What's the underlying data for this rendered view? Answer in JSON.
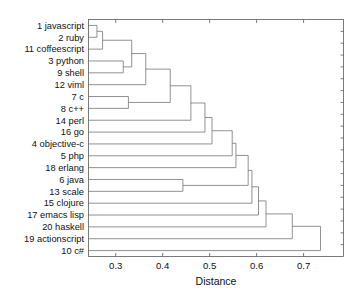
{
  "chart_data": {
    "type": "dendrogram",
    "title": "",
    "xlabel": "Distance",
    "ylabel": "",
    "xlim": [
      0.242,
      0.785
    ],
    "ylim": [
      0,
      20
    ],
    "grid": false,
    "legend": null,
    "orientation": "horizontal-left-to-right",
    "xticks": [
      0.3,
      0.4,
      0.5,
      0.6,
      0.7
    ],
    "xtick_labels": [
      "0.3",
      "0.4",
      "0.5",
      "0.6",
      "0.7"
    ],
    "leaf_order": [
      "1 javascript",
      "2 ruby",
      "11 coffeescript",
      "3 python",
      "9 shell",
      "12 viml",
      "7 c",
      "8 c++",
      "14 perl",
      "16 go",
      "4 objective-c",
      "5 php",
      "18 erlang",
      "6 java",
      "13 scale",
      "15 clojure",
      "17 emacs lisp",
      "20 haskell",
      "19 actionscript",
      "10 c#"
    ],
    "leaves": [
      {
        "index": 0,
        "id": 1,
        "name": "javascript"
      },
      {
        "index": 1,
        "id": 2,
        "name": "ruby"
      },
      {
        "index": 2,
        "id": 11,
        "name": "coffeescript"
      },
      {
        "index": 3,
        "id": 3,
        "name": "python"
      },
      {
        "index": 4,
        "id": 9,
        "name": "shell"
      },
      {
        "index": 5,
        "id": 12,
        "name": "viml"
      },
      {
        "index": 6,
        "id": 7,
        "name": "c"
      },
      {
        "index": 7,
        "id": 8,
        "name": "c++"
      },
      {
        "index": 8,
        "id": 14,
        "name": "perl"
      },
      {
        "index": 9,
        "id": 16,
        "name": "go"
      },
      {
        "index": 10,
        "id": 4,
        "name": "objective-c"
      },
      {
        "index": 11,
        "id": 5,
        "name": "php"
      },
      {
        "index": 12,
        "id": 18,
        "name": "erlang"
      },
      {
        "index": 13,
        "id": 6,
        "name": "java"
      },
      {
        "index": 14,
        "id": 13,
        "name": "scale"
      },
      {
        "index": 15,
        "id": 15,
        "name": "clojure"
      },
      {
        "index": 16,
        "id": 17,
        "name": "emacs lisp"
      },
      {
        "index": 17,
        "id": 20,
        "name": "haskell"
      },
      {
        "index": 18,
        "id": 19,
        "name": "actionscript"
      },
      {
        "index": 19,
        "id": 10,
        "name": "c#"
      }
    ],
    "merges": [
      {
        "id": "m1",
        "left": "leaf:0",
        "right": "leaf:1",
        "distance": 0.26,
        "label": "javascript + ruby"
      },
      {
        "id": "m2",
        "left": "m1",
        "right": "leaf:2",
        "distance": 0.272,
        "label": "+ coffeescript"
      },
      {
        "id": "m3",
        "left": "leaf:3",
        "right": "leaf:4",
        "distance": 0.316,
        "label": "python + shell"
      },
      {
        "id": "m4",
        "left": "m2",
        "right": "m3",
        "distance": 0.334,
        "label": "script-cluster"
      },
      {
        "id": "m5",
        "left": "m4",
        "right": "leaf:5",
        "distance": 0.364,
        "label": "+ viml"
      },
      {
        "id": "m6",
        "left": "leaf:6",
        "right": "leaf:7",
        "distance": 0.327,
        "label": "c + c++"
      },
      {
        "id": "m7",
        "left": "m5",
        "right": "m6",
        "distance": 0.416,
        "label": "c-family join"
      },
      {
        "id": "m8",
        "left": "m7",
        "right": "leaf:8",
        "distance": 0.46,
        "label": "+ perl"
      },
      {
        "id": "m9",
        "left": "m8",
        "right": "leaf:9",
        "distance": 0.49,
        "label": "+ go"
      },
      {
        "id": "m10",
        "left": "m9",
        "right": "leaf:10",
        "distance": 0.505,
        "label": "+ objective-c"
      },
      {
        "id": "m11",
        "left": "m10",
        "right": "leaf:11",
        "distance": 0.548,
        "label": "+ php"
      },
      {
        "id": "m12",
        "left": "leaf:13",
        "right": "leaf:14",
        "distance": 0.443,
        "label": "java + scale"
      },
      {
        "id": "m13",
        "left": "m11",
        "right": "leaf:12",
        "distance": 0.556,
        "label": "+ erlang"
      },
      {
        "id": "m14",
        "left": "m13",
        "right": "m12",
        "distance": 0.582,
        "label": "join java/scale"
      },
      {
        "id": "m15",
        "left": "m14",
        "right": "leaf:15",
        "distance": 0.59,
        "label": "+ clojure"
      },
      {
        "id": "m16",
        "left": "m15",
        "right": "leaf:16",
        "distance": 0.604,
        "label": "+ emacs lisp"
      },
      {
        "id": "m17",
        "left": "m16",
        "right": "leaf:17",
        "distance": 0.62,
        "label": "+ haskell"
      },
      {
        "id": "m18",
        "left": "m17",
        "right": "leaf:18",
        "distance": 0.676,
        "label": "+ actionscript"
      },
      {
        "id": "m19",
        "left": "m18",
        "right": "leaf:19",
        "distance": 0.736,
        "label": "root + c#"
      }
    ]
  },
  "axis": {
    "x_title": "Distance"
  },
  "colors": {
    "line": "#6e6e6e",
    "frame": "#5a5a5a",
    "text": "#111111",
    "background": "#ffffff"
  }
}
